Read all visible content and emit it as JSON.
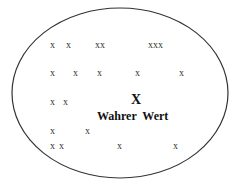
{
  "diagram": {
    "ellipse": {
      "cx": 120,
      "cy": 93,
      "rx": 108,
      "ry": 85,
      "stroke": "#333333"
    },
    "marks": [
      {
        "text": "x",
        "x": 50,
        "y": 40
      },
      {
        "text": "x",
        "x": 66,
        "y": 40
      },
      {
        "text": "xx",
        "x": 95,
        "y": 40
      },
      {
        "text": "xxx",
        "x": 148,
        "y": 40
      },
      {
        "text": "x",
        "x": 50,
        "y": 68
      },
      {
        "text": "x",
        "x": 73,
        "y": 68
      },
      {
        "text": "x",
        "x": 97,
        "y": 68
      },
      {
        "text": "x",
        "x": 135,
        "y": 68
      },
      {
        "text": "x",
        "x": 179,
        "y": 68
      },
      {
        "text": "x",
        "x": 50,
        "y": 97
      },
      {
        "text": "x",
        "x": 63,
        "y": 97
      },
      {
        "text": "x",
        "x": 50,
        "y": 126
      },
      {
        "text": "x",
        "x": 85,
        "y": 126
      },
      {
        "text": "x",
        "x": 50,
        "y": 141
      },
      {
        "text": "x",
        "x": 59,
        "y": 141
      },
      {
        "text": "x",
        "x": 117,
        "y": 141
      },
      {
        "text": "x",
        "x": 173,
        "y": 141
      }
    ],
    "true_value": {
      "mark": "X",
      "label": "Wahrer  Wert"
    }
  }
}
